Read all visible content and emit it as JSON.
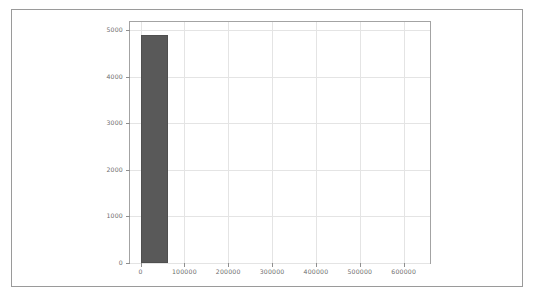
{
  "figure": {
    "background_color": "#ffffff",
    "border_color": "#9a9a9a",
    "axes_edge_color": "#a3a3a3",
    "grid_color": "#e4e4e4",
    "bar_color": "#595959",
    "tick_label_color": "#6e6e6e"
  },
  "chart_data": {
    "type": "bar",
    "title": "",
    "xlabel": "",
    "ylabel": "",
    "grid": true,
    "legend": null,
    "xlim": [
      -24000,
      660000
    ],
    "ylim": [
      0,
      5180
    ],
    "xticks": [
      0,
      100000,
      200000,
      300000,
      400000,
      500000,
      600000
    ],
    "xtick_labels": [
      "0",
      "100000",
      "200000",
      "300000",
      "400000",
      "500000",
      "600000"
    ],
    "yticks": [
      0,
      1000,
      2000,
      3000,
      4000,
      5000
    ],
    "ytick_labels": [
      "0",
      "1000",
      "2000",
      "3000",
      "4000",
      "5000"
    ],
    "bins": [
      {
        "x_left": 0,
        "x_right": 62000,
        "value": 4900
      }
    ],
    "categories": [
      "0-62000"
    ],
    "values": [
      4900
    ]
  }
}
